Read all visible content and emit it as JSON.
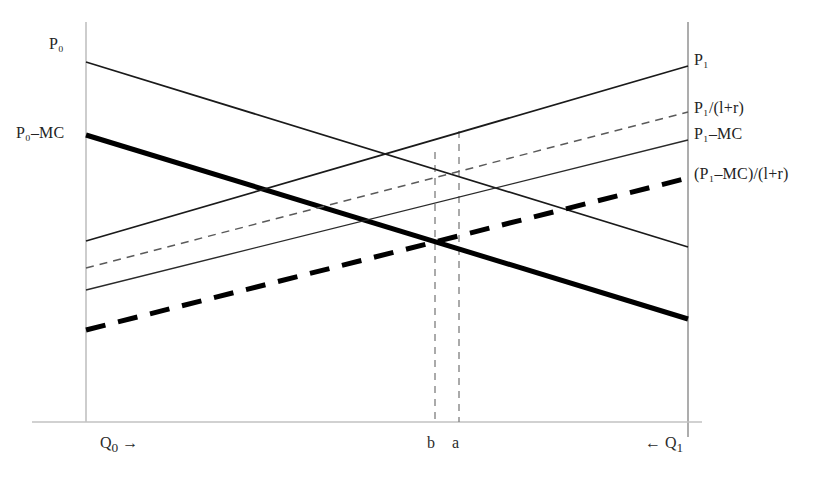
{
  "figure": {
    "domain": "diagram",
    "background": "#ffffff",
    "width": 826,
    "height": 479
  },
  "labels": {
    "left": [
      {
        "id": "p0",
        "name": "label-p-zero",
        "text": "P₀",
        "base": "P",
        "sub": "o",
        "suffix": ""
      },
      {
        "id": "p0mc",
        "name": "label-p-zero-minus-mc",
        "text": "P₀–MC",
        "base": "P",
        "sub": "o",
        "suffix": "–MC"
      }
    ],
    "right": [
      {
        "id": "p1",
        "name": "label-p-one",
        "base": "P",
        "sub": "1",
        "suffix": ""
      },
      {
        "id": "p1r",
        "name": "label-p-one-over-one-plus-r",
        "base": "P",
        "sub": "1",
        "suffix": "/(l+r)"
      },
      {
        "id": "p1mc",
        "name": "label-p-one-minus-mc",
        "base": "P",
        "sub": "1",
        "suffix": "–MC"
      },
      {
        "id": "p1mcr",
        "name": "label-p-one-minus-mc-over-r",
        "prefix": "(",
        "base": "P",
        "sub": "1",
        "suffix": "–MC)/(l+r)"
      }
    ],
    "bottom": [
      {
        "id": "q0",
        "name": "axis-label-q-zero",
        "base": "Q",
        "sub": "0",
        "suffix": " →",
        "prefix": ""
      },
      {
        "id": "b",
        "name": "axis-label-b",
        "base": "b",
        "sub": "",
        "suffix": "",
        "prefix": ""
      },
      {
        "id": "a",
        "name": "axis-label-a",
        "base": "a",
        "sub": "",
        "suffix": "",
        "prefix": ""
      },
      {
        "id": "q1",
        "name": "axis-label-q-one",
        "base": "Q",
        "sub": "1",
        "suffix": "",
        "prefix": "← "
      }
    ]
  },
  "chart_data": {
    "type": "line",
    "title": "",
    "xlabel": "",
    "ylabel": "",
    "grid": false,
    "legend": "none",
    "axes": {
      "left_vertical": {
        "x": 86,
        "y_top": 22,
        "y_bottom": 422,
        "color": "#b8b8b8",
        "width": 1.4
      },
      "right_vertical": {
        "x": 688,
        "y_top": 22,
        "y_bottom": 437,
        "color": "#8a8a8a",
        "width": 1.4
      },
      "bottom_horizontal": {
        "y": 422,
        "x_left": 32,
        "x_right": 702,
        "color": "#c2c2c2",
        "width": 1.4
      }
    },
    "series": [
      {
        "name": "P₀",
        "key": "p0",
        "style": "solid-thin",
        "stroke": "#1a1a1a",
        "width": 1.7,
        "dash": "none",
        "points": [
          [
            86,
            62
          ],
          [
            688,
            247
          ]
        ],
        "direction": "descending",
        "label_side": "left"
      },
      {
        "name": "P₀–MC",
        "key": "p0mc",
        "style": "solid-thick",
        "stroke": "#000000",
        "width": 5.0,
        "dash": "none",
        "points": [
          [
            86,
            135
          ],
          [
            688,
            319
          ]
        ],
        "direction": "descending",
        "label_side": "left"
      },
      {
        "name": "P₁",
        "key": "p1",
        "style": "solid-thin",
        "stroke": "#1a1a1a",
        "width": 1.7,
        "dash": "none",
        "points": [
          [
            86,
            241
          ],
          [
            688,
            66
          ]
        ],
        "direction": "ascending",
        "label_side": "right"
      },
      {
        "name": "P₁/(l+r)",
        "key": "p1r",
        "style": "dashed-thin",
        "stroke": "#5a5a5a",
        "width": 1.5,
        "dash": "8,6",
        "points": [
          [
            86,
            268
          ],
          [
            688,
            112
          ]
        ],
        "direction": "ascending",
        "label_side": "right"
      },
      {
        "name": "P₁–MC",
        "key": "p1mc",
        "style": "solid-thin",
        "stroke": "#2a2a2a",
        "width": 1.4,
        "dash": "none",
        "points": [
          [
            86,
            290
          ],
          [
            688,
            140
          ]
        ],
        "direction": "ascending",
        "label_side": "right"
      },
      {
        "name": "(P₁–MC)/(l+r)",
        "key": "p1mcr",
        "style": "dashed-thick",
        "stroke": "#000000",
        "width": 5.0,
        "dash": "20,13",
        "points": [
          [
            86,
            330
          ],
          [
            688,
            178
          ]
        ],
        "direction": "ascending",
        "label_side": "right"
      }
    ],
    "vertical_markers": [
      {
        "name": "b",
        "x": 435,
        "y_top": 152,
        "y_bottom": 422,
        "dash": "7,6",
        "stroke": "#7d7d7d",
        "width": 1.3
      },
      {
        "name": "a",
        "x": 459,
        "y_top": 131,
        "y_bottom": 422,
        "dash": "7,6",
        "stroke": "#7d7d7d",
        "width": 1.3
      }
    ],
    "intersections": [
      {
        "name": "upper-crossing",
        "x": 390,
        "y": 156,
        "between": [
          "P₀",
          "P₁"
        ]
      },
      {
        "name": "lower-crossing",
        "x": 435,
        "y": 243,
        "between": [
          "P₀–MC",
          "(P₁–MC)/(l+r)"
        ]
      }
    ]
  }
}
